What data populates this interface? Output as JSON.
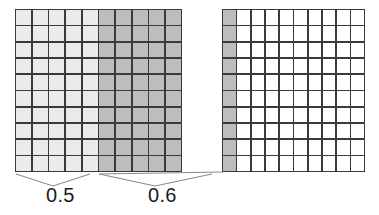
{
  "figure": {
    "type": "decimal-grid-diagram",
    "colors": {
      "grid_line": "#3a3a3a",
      "shade_light": "#ebebeb",
      "shade_medium": "#bdbdbd",
      "unshaded": "#ffffff",
      "text": "#1a1a1a",
      "leader_line": "#8a8a8a"
    }
  },
  "grids": [
    {
      "name": "overview-grid",
      "rows": 10,
      "columns": 10,
      "column_fills": [
        "fill-light",
        "fill-light",
        "fill-light",
        "fill-light",
        "fill-light",
        "fill-mid",
        "fill-mid",
        "fill-mid",
        "fill-mid",
        "fill-mid"
      ],
      "shaded_light_columns": 5,
      "shaded_medium_columns": 5
    },
    {
      "name": "detail-grid",
      "rows": 10,
      "columns": 10,
      "column_fills": [
        "fill-mid",
        "fill-white",
        "fill-white",
        "fill-white",
        "fill-white",
        "fill-white",
        "fill-white",
        "fill-white",
        "fill-white",
        "fill-white"
      ],
      "shaded_medium_columns": 1,
      "unshaded_columns": 9
    }
  ],
  "braces": [
    {
      "name": "brace-first",
      "label": "0.5",
      "spans_columns": 5
    },
    {
      "name": "brace-second",
      "label": "0.6",
      "spans_columns": 5
    }
  ],
  "labels": {
    "first": "0.5",
    "second": "0.6"
  },
  "chart_data": {
    "type": "bar",
    "title": "",
    "categories": [
      "0.5",
      "0.6"
    ],
    "values": [
      0.5,
      0.6
    ],
    "xlabel": "",
    "ylabel": ""
  }
}
